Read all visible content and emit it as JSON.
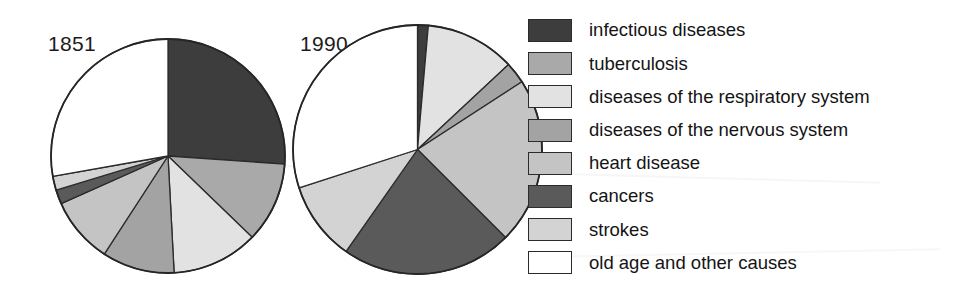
{
  "figure": {
    "background": "#ffffff",
    "width": 960,
    "height": 298
  },
  "legend": {
    "position": "right",
    "items": [
      {
        "label": "infectious diseases",
        "color": "#3d3d3d",
        "key": "infectious"
      },
      {
        "label": "tuberculosis",
        "color": "#a9a9a9",
        "key": "tuberculosis"
      },
      {
        "label": "diseases of the respiratory system",
        "color": "#e2e2e2",
        "key": "respiratory"
      },
      {
        "label": "diseases of the nervous system",
        "color": "#a3a3a3",
        "key": "nervous"
      },
      {
        "label": "heart disease",
        "color": "#c4c4c4",
        "key": "heart"
      },
      {
        "label": "cancers",
        "color": "#5a5a5a",
        "key": "cancers"
      },
      {
        "label": "strokes",
        "color": "#d3d3d3",
        "key": "strokes"
      },
      {
        "label": "old age and other causes",
        "color": "#ffffff",
        "key": "old_age"
      }
    ]
  },
  "chart_data": {
    "type": "pie",
    "title": "",
    "xlabel": "",
    "ylabel": "",
    "units": "percent of deaths",
    "categories": [
      "infectious diseases",
      "tuberculosis",
      "diseases of the respiratory system",
      "diseases of the nervous system",
      "heart disease",
      "cancers",
      "strokes",
      "old age and other causes"
    ],
    "colors": [
      "#3d3d3d",
      "#a9a9a9",
      "#e2e2e2",
      "#a3a3a3",
      "#c4c4c4",
      "#5a5a5a",
      "#d3d3d3",
      "#ffffff"
    ],
    "legend_position": "right",
    "grid": false,
    "start_angle_deg": 0,
    "direction": "clockwise",
    "charts": [
      {
        "name": "1851",
        "label": "1851",
        "values": [
          26,
          11,
          12,
          10,
          9,
          2,
          2,
          28
        ],
        "angles_deg": [
          94,
          40,
          43,
          36,
          33,
          7,
          7,
          100
        ]
      },
      {
        "name": "1990",
        "label": "1990",
        "values": [
          1,
          0,
          12,
          3,
          22,
          22,
          10,
          30
        ],
        "angles_deg": [
          5,
          0,
          42,
          10,
          78,
          80,
          37,
          108
        ]
      }
    ]
  }
}
